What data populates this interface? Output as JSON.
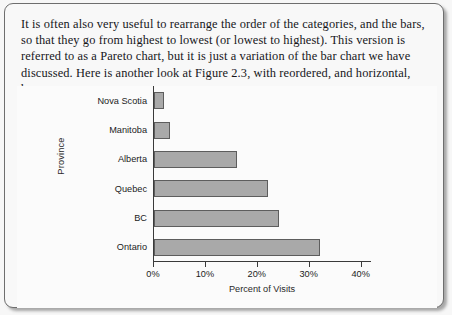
{
  "document": {
    "paragraph": "It is often also very useful to rearrange the order of the categories, and the bars, so that they go from highest to lowest (or lowest to highest). This version is referred to as a Pareto chart, but it is just a variation of the bar chart we have discussed. Here is another look at Figure 2.3, with reordered, and horizontal, bars."
  },
  "chart_data": {
    "type": "bar",
    "orientation": "horizontal",
    "title": "",
    "categories": [
      "Nova Scotia",
      "Manitoba",
      "Alberta",
      "Quebec",
      "BC",
      "Ontario"
    ],
    "values": [
      2,
      3,
      16,
      22,
      24,
      32
    ],
    "xlabel": "Percent of Visits",
    "ylabel": "Province",
    "xlim": [
      0,
      42
    ],
    "xticks": [
      0,
      10,
      20,
      30,
      40
    ],
    "xtick_labels": [
      "0%",
      "10%",
      "20%",
      "30%",
      "40%"
    ],
    "grid": false,
    "legend": null,
    "bar_color": "#a9a9a9",
    "bar_edge_color": "#5d5d5d",
    "plot_background": "#fbfbfb"
  }
}
